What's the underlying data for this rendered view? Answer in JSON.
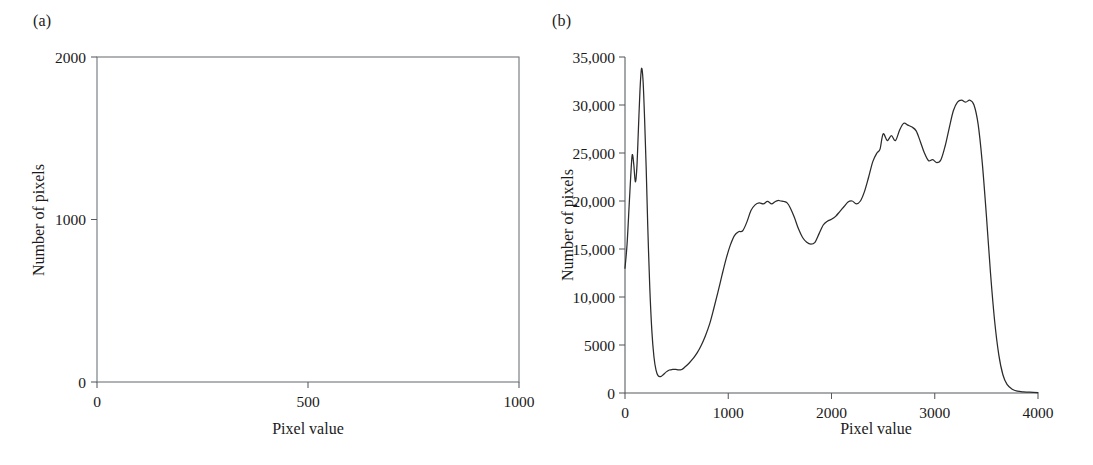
{
  "figure": {
    "background": "#ffffff",
    "line_color": "#2b2b2b",
    "frame_color": "#6a6f73",
    "text_color": "#1a1a1a"
  },
  "panels": {
    "a": {
      "tag": "(a)",
      "xlabel": "Pixel value",
      "ylabel": "Number of pixels"
    },
    "b": {
      "tag": "(b)",
      "xlabel": "Pixel value",
      "ylabel": "Number of pixels"
    }
  },
  "chart_data": [
    {
      "type": "line",
      "panel": "a",
      "title": "(a)",
      "xlabel": "Pixel value",
      "ylabel": "Number of pixels",
      "xlim": [
        0,
        1000
      ],
      "ylim": [
        0,
        2000
      ],
      "xticks": [
        0,
        500,
        1000
      ],
      "xtick_labels": [
        "0",
        "500",
        "1000"
      ],
      "yticks": [
        0,
        1000,
        2000
      ],
      "ytick_labels": [
        "0",
        "1000",
        "2000"
      ],
      "grid": false,
      "legend": null,
      "frame": "box",
      "series": [
        {
          "name": "histogram",
          "x": [],
          "y": []
        }
      ],
      "note": "empty axes - no data plotted"
    },
    {
      "type": "line",
      "panel": "b",
      "title": "(b)",
      "xlabel": "Pixel value",
      "ylabel": "Number of pixels",
      "xlim": [
        0,
        4000
      ],
      "ylim": [
        0,
        35000
      ],
      "xticks": [
        0,
        1000,
        2000,
        3000,
        4000
      ],
      "xtick_labels": [
        "0",
        "1000",
        "2000",
        "3000",
        "4000"
      ],
      "yticks": [
        0,
        5000,
        10000,
        15000,
        20000,
        25000,
        30000,
        35000
      ],
      "ytick_labels": [
        "0",
        "5000",
        "10,000",
        "15,000",
        "20,000",
        "25,000",
        "30,000",
        "35,000"
      ],
      "grid": false,
      "legend": null,
      "frame": "left-bottom",
      "series": [
        {
          "name": "histogram",
          "x": [
            0,
            20,
            40,
            55,
            70,
            85,
            100,
            115,
            130,
            145,
            160,
            175,
            190,
            205,
            220,
            240,
            260,
            280,
            300,
            320,
            345,
            370,
            400,
            430,
            460,
            490,
            520,
            550,
            580,
            620,
            660,
            700,
            740,
            780,
            820,
            860,
            900,
            940,
            980,
            1020,
            1060,
            1100,
            1140,
            1180,
            1220,
            1260,
            1300,
            1340,
            1380,
            1420,
            1450,
            1480,
            1510,
            1540,
            1570,
            1600,
            1640,
            1680,
            1720,
            1760,
            1800,
            1840,
            1880,
            1920,
            1960,
            2000,
            2040,
            2080,
            2120,
            2160,
            2200,
            2240,
            2280,
            2320,
            2360,
            2400,
            2440,
            2470,
            2500,
            2540,
            2580,
            2620,
            2660,
            2700,
            2740,
            2780,
            2820,
            2860,
            2900,
            2940,
            2980,
            3020,
            3060,
            3100,
            3140,
            3180,
            3220,
            3260,
            3300,
            3340,
            3380,
            3420,
            3460,
            3500,
            3540,
            3580,
            3620,
            3660,
            3700,
            3750,
            3800,
            3860,
            3920,
            4000
          ],
          "y": [
            13000,
            15500,
            19500,
            22500,
            24800,
            23800,
            22000,
            23500,
            27500,
            31500,
            33800,
            32500,
            28500,
            23500,
            17500,
            11000,
            6500,
            3800,
            2400,
            1800,
            1700,
            1900,
            2200,
            2400,
            2450,
            2450,
            2400,
            2450,
            2700,
            3100,
            3600,
            4200,
            5000,
            6000,
            7200,
            8800,
            10500,
            12300,
            14000,
            15400,
            16400,
            16800,
            16900,
            17800,
            19000,
            19600,
            19800,
            19700,
            19950,
            19700,
            19900,
            20050,
            20000,
            19950,
            19800,
            19300,
            18300,
            17100,
            16200,
            15700,
            15500,
            15700,
            16600,
            17500,
            17900,
            18100,
            18400,
            18900,
            19400,
            19900,
            20000,
            19700,
            20000,
            21000,
            22500,
            24100,
            25000,
            25400,
            27000,
            26300,
            26800,
            26300,
            27400,
            28100,
            27900,
            27700,
            27300,
            26200,
            25000,
            24200,
            24300,
            24000,
            24300,
            25700,
            27600,
            29400,
            30300,
            30500,
            30300,
            30500,
            30000,
            28000,
            24000,
            18500,
            12500,
            7500,
            4000,
            1900,
            900,
            400,
            200,
            120,
            80,
            50,
            30
          ]
        }
      ]
    }
  ]
}
